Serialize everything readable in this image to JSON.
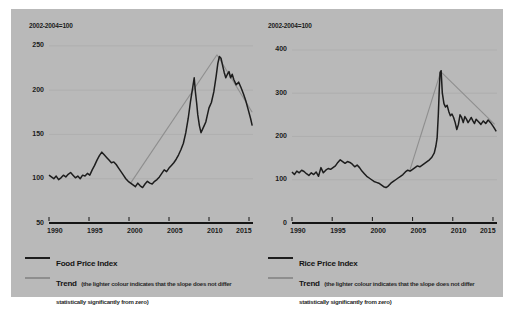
{
  "figure": {
    "background_color": "#ffffff",
    "panel_color": "#b9b9b9",
    "series_color": "#1d1d1d",
    "trend_color": "#8e8e8e",
    "trend_light_color": "#a8a8a8"
  },
  "charts": [
    {
      "id": "food-price-index",
      "axis_note": "2002-2004=100",
      "legend": {
        "index_label": "Food Price Index",
        "trend_label": "Trend",
        "trend_caption": "(the lighter colour indicates that the slope does not differ statistically significantly from zero)"
      }
    },
    {
      "id": "rice-price-index",
      "axis_note": "2002-2004=100",
      "legend": {
        "index_label": "Rice Price Index",
        "trend_label": "Trend",
        "trend_caption": "(the lighter colour indicates that the slope does not differ statistically significantly from zero)"
      }
    }
  ],
  "chart_data": [
    {
      "type": "line",
      "id": "food-price-index",
      "title": "Food Price Index",
      "subtitle": "2002-2004=100",
      "xlabel": "",
      "ylabel": "",
      "xlim": [
        1990,
        2015.5
      ],
      "ylim": [
        50,
        260
      ],
      "yticks": [
        50,
        100,
        150,
        200,
        250
      ],
      "xticks": [
        1990,
        1995,
        2000,
        2005,
        2010,
        2015
      ],
      "grid": true,
      "legend_position": "below",
      "series": [
        {
          "name": "Food Price Index",
          "color": "#1d1d1d",
          "x": [
            1990.0,
            1990.3,
            1990.6,
            1990.9,
            1991.2,
            1991.5,
            1991.8,
            1992.1,
            1992.4,
            1992.7,
            1993.0,
            1993.3,
            1993.6,
            1993.9,
            1994.2,
            1994.5,
            1994.8,
            1995.1,
            1995.4,
            1995.7,
            1996.0,
            1996.3,
            1996.6,
            1996.9,
            1997.2,
            1997.5,
            1997.8,
            1998.1,
            1998.4,
            1998.7,
            1999.0,
            1999.3,
            1999.6,
            1999.9,
            2000.2,
            2000.5,
            2000.8,
            2001.1,
            2001.4,
            2001.7,
            2002.0,
            2002.3,
            2002.6,
            2002.9,
            2003.2,
            2003.5,
            2003.8,
            2004.1,
            2004.4,
            2004.7,
            2005.0,
            2005.3,
            2005.6,
            2005.9,
            2006.2,
            2006.5,
            2006.8,
            2007.1,
            2007.4,
            2007.7,
            2008.0,
            2008.15,
            2008.3,
            2008.45,
            2008.6,
            2008.8,
            2009.0,
            2009.2,
            2009.4,
            2009.6,
            2009.8,
            2010.0,
            2010.3,
            2010.6,
            2010.9,
            2011.1,
            2011.3,
            2011.5,
            2011.7,
            2011.9,
            2012.1,
            2012.3,
            2012.5,
            2012.7,
            2012.9,
            2013.1,
            2013.4,
            2013.7,
            2014.0,
            2014.3,
            2014.6,
            2014.9,
            2015.2,
            2015.4
          ],
          "y": [
            104,
            102,
            100,
            103,
            99,
            101,
            104,
            102,
            105,
            107,
            104,
            101,
            103,
            100,
            104,
            103,
            106,
            104,
            110,
            115,
            121,
            126,
            130,
            127,
            124,
            121,
            118,
            119,
            116,
            112,
            108,
            104,
            100,
            97,
            95,
            93,
            91,
            95,
            92,
            90,
            94,
            97,
            95,
            94,
            97,
            99,
            102,
            106,
            110,
            108,
            112,
            115,
            118,
            122,
            127,
            133,
            140,
            152,
            168,
            188,
            205,
            214,
            198,
            186,
            172,
            160,
            152,
            156,
            160,
            164,
            172,
            180,
            186,
            198,
            216,
            230,
            238,
            236,
            228,
            220,
            214,
            218,
            221,
            214,
            218,
            212,
            206,
            209,
            203,
            196,
            188,
            178,
            168,
            160
          ]
        }
      ],
      "trends": [
        {
          "name": "Trend up",
          "significant": true,
          "color": "#8e8e8e",
          "x": [
            2000.2,
            2011.0
          ],
          "y": [
            95,
            240
          ]
        },
        {
          "name": "Trend down",
          "significant": true,
          "color": "#8e8e8e",
          "x": [
            2011.0,
            2015.4
          ],
          "y": [
            240,
            175
          ]
        }
      ]
    },
    {
      "type": "line",
      "id": "rice-price-index",
      "title": "Rice Price Index",
      "subtitle": "2002-2004=100",
      "xlabel": "",
      "ylabel": "",
      "xlim": [
        1990,
        2015.5
      ],
      "ylim": [
        0,
        430
      ],
      "yticks": [
        0,
        100,
        200,
        300,
        400
      ],
      "xticks": [
        1990,
        1995,
        2000,
        2005,
        2010,
        2015
      ],
      "grid": true,
      "legend_position": "below",
      "series": [
        {
          "name": "Rice Price Index",
          "color": "#1d1d1d",
          "x": [
            1990.0,
            1990.3,
            1990.6,
            1990.9,
            1991.2,
            1991.5,
            1991.8,
            1992.1,
            1992.4,
            1992.7,
            1993.0,
            1993.3,
            1993.6,
            1993.9,
            1994.2,
            1994.5,
            1994.8,
            1995.1,
            1995.4,
            1995.7,
            1996.0,
            1996.3,
            1996.6,
            1996.9,
            1997.2,
            1997.5,
            1997.8,
            1998.1,
            1998.4,
            1998.7,
            1999.0,
            1999.3,
            1999.6,
            1999.9,
            2000.2,
            2000.5,
            2000.8,
            2001.1,
            2001.4,
            2001.7,
            2002.0,
            2002.3,
            2002.6,
            2002.9,
            2003.2,
            2003.5,
            2003.8,
            2004.1,
            2004.4,
            2004.7,
            2005.0,
            2005.3,
            2005.6,
            2005.9,
            2006.2,
            2006.5,
            2006.8,
            2007.1,
            2007.4,
            2007.7,
            2007.9,
            2008.05,
            2008.2,
            2008.32,
            2008.42,
            2008.55,
            2008.7,
            2008.9,
            2009.1,
            2009.3,
            2009.5,
            2009.7,
            2009.9,
            2010.1,
            2010.3,
            2010.5,
            2010.7,
            2010.9,
            2011.1,
            2011.3,
            2011.5,
            2011.7,
            2011.9,
            2012.1,
            2012.3,
            2012.5,
            2012.7,
            2012.9,
            2013.2,
            2013.5,
            2013.8,
            2014.1,
            2014.4,
            2014.7,
            2015.0,
            2015.2,
            2015.4
          ],
          "y": [
            118,
            112,
            120,
            116,
            122,
            119,
            114,
            110,
            116,
            112,
            118,
            108,
            128,
            116,
            122,
            126,
            124,
            128,
            132,
            140,
            146,
            142,
            138,
            142,
            140,
            136,
            130,
            134,
            128,
            120,
            114,
            108,
            104,
            100,
            96,
            94,
            92,
            88,
            84,
            82,
            86,
            92,
            96,
            100,
            104,
            108,
            112,
            118,
            122,
            120,
            124,
            128,
            132,
            130,
            134,
            138,
            142,
            146,
            152,
            162,
            178,
            196,
            250,
            310,
            348,
            352,
            300,
            276,
            268,
            272,
            258,
            248,
            252,
            244,
            232,
            216,
            228,
            250,
            244,
            232,
            246,
            240,
            232,
            238,
            244,
            236,
            230,
            240,
            234,
            228,
            236,
            230,
            238,
            232,
            224,
            218,
            212
          ]
        }
      ],
      "trends": [
        {
          "name": "Trend up",
          "significant": true,
          "color": "#8e8e8e",
          "x": [
            2004.6,
            2008.5
          ],
          "y": [
            118,
            350
          ]
        },
        {
          "name": "Trend down",
          "significant": true,
          "color": "#8e8e8e",
          "x": [
            2008.5,
            2015.2
          ],
          "y": [
            350,
            228
          ]
        }
      ]
    }
  ]
}
